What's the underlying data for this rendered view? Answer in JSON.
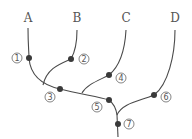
{
  "diagram": {
    "type": "phylogenetic-tree",
    "taxa": [
      {
        "label": "A",
        "x": 28,
        "y": 22
      },
      {
        "label": "B",
        "x": 77,
        "y": 22
      },
      {
        "label": "C",
        "x": 126,
        "y": 22
      },
      {
        "label": "D",
        "x": 175,
        "y": 22
      }
    ],
    "nodes": [
      {
        "label": "1",
        "dot": [
          29,
          58
        ],
        "tag": [
          17,
          58
        ]
      },
      {
        "label": "2",
        "dot": [
          71,
          59
        ],
        "tag": [
          84,
          59
        ]
      },
      {
        "label": "3",
        "dot": [
          60,
          89
        ],
        "tag": [
          50,
          97
        ]
      },
      {
        "label": "4",
        "dot": [
          109,
          75
        ],
        "tag": [
          121,
          78
        ]
      },
      {
        "label": "5",
        "dot": [
          109,
          100
        ],
        "tag": [
          97,
          107
        ]
      },
      {
        "label": "6",
        "dot": [
          154,
          95
        ],
        "tag": [
          166,
          97
        ]
      },
      {
        "label": "7",
        "dot": [
          118,
          124
        ],
        "tag": [
          129,
          124
        ]
      }
    ],
    "colors": {
      "line": "#4a4a4a",
      "dot": "#3a3a3a",
      "text": "#555555"
    }
  }
}
